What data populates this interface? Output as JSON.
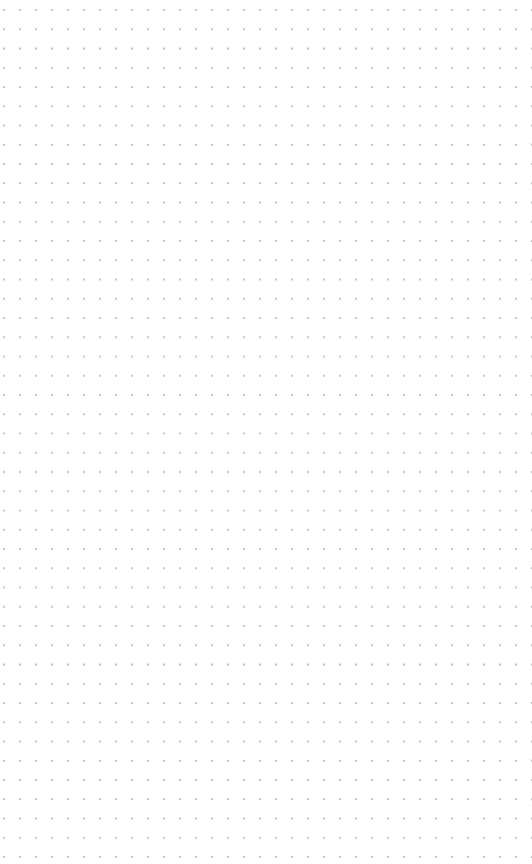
{
  "canvas": {
    "type": "dot-grid",
    "background_color": "#ffffff",
    "dot_color": "#c4c4c4",
    "dot_spacing_x": 16,
    "dot_spacing_y": 19.25
  }
}
